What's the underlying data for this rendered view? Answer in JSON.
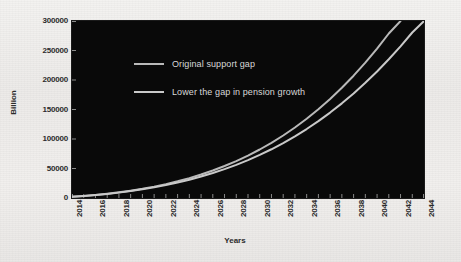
{
  "chart_data": {
    "type": "line",
    "title": "",
    "xlabel": "Years",
    "ylabel": "Billion",
    "x": [
      2014,
      2015,
      2016,
      2017,
      2018,
      2019,
      2020,
      2021,
      2022,
      2023,
      2024,
      2025,
      2026,
      2027,
      2028,
      2029,
      2030,
      2031,
      2032,
      2033,
      2034,
      2035,
      2036,
      2037,
      2038,
      2039,
      2040,
      2041,
      2042,
      2043,
      2044
    ],
    "xlim": [
      2014,
      2044
    ],
    "ylim": [
      0,
      300000
    ],
    "yticks": [
      0,
      50000,
      100000,
      150000,
      200000,
      250000,
      300000
    ],
    "ytick_labels": [
      "0",
      "50000",
      "100000",
      "150000",
      "200000",
      "250000",
      "300000"
    ],
    "xtick_labels": [
      "2014",
      "2016",
      "2018",
      "2020",
      "2022",
      "2024",
      "2026",
      "2028",
      "2030",
      "2032",
      "2034",
      "2036",
      "2038",
      "2040",
      "2042",
      "2044"
    ],
    "grid": false,
    "legend_position": "inside-upper-left",
    "plot_background": "#090909",
    "page_background": "#efedeb",
    "series": [
      {
        "name": "Original support gap",
        "color": "#b9b9b9",
        "values": [
          2000,
          3500,
          5200,
          7200,
          9600,
          12400,
          15600,
          19300,
          23500,
          28300,
          33700,
          39800,
          46600,
          54200,
          62600,
          71900,
          82200,
          93500,
          105900,
          119500,
          134300,
          150400,
          167900,
          186800,
          207300,
          229400,
          253200,
          278800,
          306300,
          335700,
          367200
        ]
      },
      {
        "name": "Lower the gap in pension growth",
        "color": "#c9c9c9",
        "values": [
          2000,
          3400,
          5000,
          6900,
          9100,
          11700,
          14700,
          18000,
          21800,
          26100,
          30900,
          36300,
          42300,
          48900,
          56200,
          64200,
          73000,
          82600,
          93100,
          104500,
          116900,
          130300,
          144800,
          160400,
          177200,
          195200,
          214500,
          235100,
          257100,
          280500,
          305400
        ]
      }
    ]
  },
  "axes": {
    "y_title": "Billion",
    "x_title": "Years"
  },
  "legend": {
    "items": [
      {
        "label": "Original support gap",
        "color": "#b9b9b9"
      },
      {
        "label": "Lower the gap in pension growth",
        "color": "#c9c9c9"
      }
    ]
  }
}
